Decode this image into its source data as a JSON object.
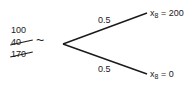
{
  "diagram": {
    "type": "probability-tree",
    "root_values": [
      {
        "value": "100",
        "struck": false
      },
      {
        "value": "40",
        "struck": true
      },
      {
        "value": "170",
        "struck": true
      }
    ],
    "root_symbol": "~",
    "branches": [
      {
        "probability": "0.5",
        "variable": "x",
        "subscript": "8",
        "equals": "= 200"
      },
      {
        "probability": "0.5",
        "variable": "x",
        "subscript": "8",
        "equals": "= 0"
      }
    ],
    "line_color": "#1a1a1a"
  }
}
